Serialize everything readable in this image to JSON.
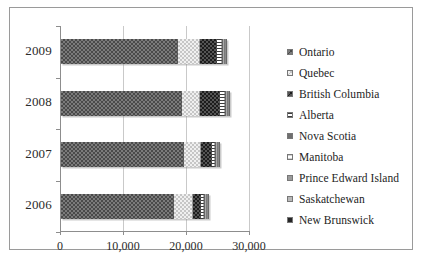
{
  "figure": {
    "border_color": "#9a9a9a",
    "background": "#ffffff"
  },
  "legend": {
    "position": "right",
    "items": [
      {
        "label": "Ontario",
        "swatch": "ontario-swatch-icon",
        "pattern": "checker-dark",
        "color": "#7b7b7b"
      },
      {
        "label": "Quebec",
        "swatch": "quebec-swatch-icon",
        "pattern": "checker-light",
        "color": "#f0f0f0"
      },
      {
        "label": "British Columbia",
        "swatch": "british-columbia-swatch-icon",
        "pattern": "checker-darker",
        "color": "#555555"
      },
      {
        "label": "Alberta",
        "swatch": "alberta-swatch-icon",
        "pattern": "horizontal-lines",
        "color": "#ffffff"
      },
      {
        "label": "Nova Scotia",
        "swatch": "nova-scotia-swatch-icon",
        "pattern": "solid",
        "color": "#6f6f6f"
      },
      {
        "label": "Manitoba",
        "swatch": "manitoba-swatch-icon",
        "pattern": "light-lines",
        "color": "#fbfbfb"
      },
      {
        "label": "Prince Edward Island",
        "swatch": "prince-edward-island-swatch-icon",
        "pattern": "solid",
        "color": "#9b9b9b"
      },
      {
        "label": "Saskatchewan",
        "swatch": "saskatchewan-swatch-icon",
        "pattern": "solid",
        "color": "#b9b9b9"
      },
      {
        "label": "New Brunswick",
        "swatch": "new-brunswick-swatch-icon",
        "pattern": "solid",
        "color": "#252525"
      }
    ]
  },
  "chart_data": {
    "type": "bar",
    "orientation": "horizontal",
    "stacked": true,
    "title": "",
    "xlabel": "",
    "ylabel": "",
    "categories": [
      "2009",
      "2008",
      "2007",
      "2006"
    ],
    "xlim": [
      0,
      30000
    ],
    "xticks": [
      0,
      10000,
      20000,
      30000
    ],
    "xticklabels": [
      "0",
      "10,000",
      "20,000",
      "30,000"
    ],
    "grid": true,
    "legend_position": "right",
    "series": [
      {
        "name": "Ontario",
        "values": [
          18600,
          19200,
          19500,
          18000
        ]
      },
      {
        "name": "Quebec",
        "values": [
          3400,
          2900,
          2700,
          2900
        ]
      },
      {
        "name": "British Columbia",
        "values": [
          2800,
          3100,
          1800,
          1400
        ]
      },
      {
        "name": "Alberta",
        "values": [
          700,
          800,
          500,
          400
        ]
      },
      {
        "name": "Nova Scotia",
        "values": [
          200,
          200,
          150,
          120
        ]
      },
      {
        "name": "Manitoba",
        "values": [
          150,
          150,
          120,
          100
        ]
      },
      {
        "name": "Prince Edward Island",
        "values": [
          60,
          60,
          50,
          40
        ]
      },
      {
        "name": "Saskatchewan",
        "values": [
          60,
          60,
          50,
          40
        ]
      },
      {
        "name": "New Brunswick",
        "values": [
          180,
          180,
          140,
          110
        ]
      }
    ],
    "totals": [
      26150,
      26650,
      25010,
      23110
    ]
  }
}
